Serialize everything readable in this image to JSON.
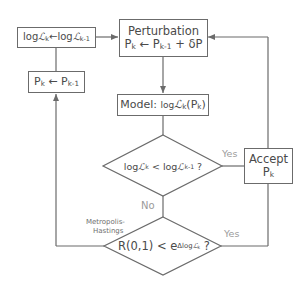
{
  "diagram": {
    "type": "flowchart",
    "colors": {
      "line": "#6b6b6b",
      "text": "#4a4a4a",
      "label": "#9a9a9a",
      "background": "#ffffff"
    },
    "nodes": {
      "update_loglik": {
        "log": "log",
        "L": "ℒ",
        "k": "k",
        "arrow": "←",
        "log2": "log",
        "L2": "ℒ",
        "km1": "k-1"
      },
      "revert_params": {
        "P": "P",
        "k": "k",
        "arrow": "←",
        "P2": "P",
        "km1": "k-1"
      },
      "perturbation": {
        "title": "Perturbation",
        "P": "P",
        "k": "k",
        "arrow": "←",
        "P2": "P",
        "km1": "k-1",
        "plus": "+ δP"
      },
      "model": {
        "prefix": "Model: ",
        "log": "log",
        "L": "ℒ",
        "k": "k",
        "paren_open": "(P",
        "pk": "k",
        "paren_close": ")"
      },
      "decision_likelihood": {
        "log": "log",
        "L": "ℒ",
        "k": "k",
        "lt": " < log",
        "L2": "ℒ",
        "km1": "k-1",
        "q": " ?"
      },
      "decision_metropolis": {
        "lhs": "R(0,1) < e",
        "sup_delta": "Δlog",
        "sup_L": "ℒ",
        "sup_k": "k",
        "q": " ?"
      },
      "accept": {
        "line1": "Accept",
        "P": "P",
        "k": "k"
      }
    },
    "labels": {
      "yes_1": "Yes",
      "yes_2": "Yes",
      "no": "No",
      "metropolis_1": "Metropolis-",
      "metropolis_2": "Hastings"
    }
  }
}
